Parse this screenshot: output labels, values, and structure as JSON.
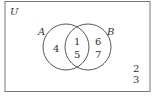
{
  "diagram": {
    "type": "venn",
    "universe_label": "U",
    "sets": [
      {
        "name": "A",
        "only": [
          "4"
        ]
      },
      {
        "name": "B",
        "only": [
          "6",
          "7"
        ]
      }
    ],
    "intersection": [
      "1",
      "5"
    ],
    "outside": [
      "2",
      "3"
    ]
  },
  "colors": {
    "line": "#555555",
    "text": "#333333",
    "background": "#ffffff"
  }
}
